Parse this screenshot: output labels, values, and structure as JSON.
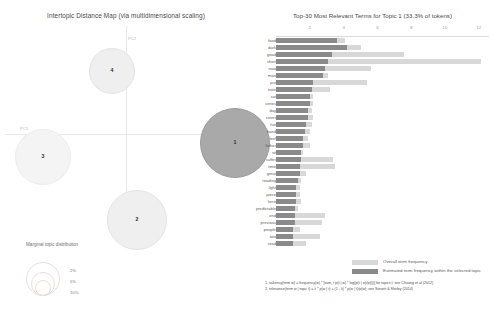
{
  "intertopic": {
    "title": "Intertopic Distance Map (via multidimensional scaling)",
    "axis": {
      "x_label": "PC1",
      "y_label": "PC2"
    },
    "topics": [
      {
        "id": "1",
        "label": "1",
        "x": 229,
        "y": 143,
        "r": 35,
        "style": "selected"
      },
      {
        "id": "2",
        "label": "2",
        "x": 131,
        "y": 220,
        "r": 30,
        "style": "plain"
      },
      {
        "id": "3",
        "label": "3",
        "x": 37,
        "y": 157,
        "r": 28,
        "style": "faint"
      },
      {
        "id": "4",
        "label": "4",
        "x": 106,
        "y": 71,
        "r": 23,
        "style": "plain"
      }
    ],
    "marginal_legend": {
      "title": "Marginal topic distribution",
      "sizes": [
        "2%",
        "5%",
        "10%"
      ]
    }
  },
  "barchart": {
    "title": "Top-30 Most Relevant Terms for Topic 1 (33.3% of tokens)",
    "topic_number": "1",
    "topic_share": "33.3% of tokens",
    "axis": {
      "ticks": [
        "2",
        "4",
        "6",
        "8",
        "10",
        "12"
      ],
      "max": 12.6
    },
    "legend": [
      {
        "swatch": "#d8d8d8",
        "label": "Overall term frequency"
      },
      {
        "swatch": "#8a8a8a",
        "label": "Estimated term frequency within the selected topic"
      }
    ],
    "colors": {
      "overall": "#d8d8d8",
      "topic": "#8a8a8a",
      "selected_bubble": "#a9a9a9",
      "plain_bubble": "#efefef"
    },
    "terms": [
      {
        "term": "food",
        "overall": 4.1,
        "topic": 3.6
      },
      {
        "term": "dark",
        "overall": 5.0,
        "topic": 4.2
      },
      {
        "term": "good",
        "overall": 7.6,
        "topic": 3.3
      },
      {
        "term": "short",
        "overall": 12.1,
        "topic": 3.1
      },
      {
        "term": "now",
        "overall": 5.6,
        "topic": 2.9
      },
      {
        "term": "man",
        "overall": 3.1,
        "topic": 2.8
      },
      {
        "term": "put",
        "overall": 5.4,
        "topic": 2.2
      },
      {
        "term": "note",
        "overall": 3.2,
        "topic": 2.1
      },
      {
        "term": "sat",
        "overall": 2.2,
        "topic": 2.0
      },
      {
        "term": "series",
        "overall": 2.2,
        "topic": 2.0
      },
      {
        "term": "day",
        "overall": 2.1,
        "topic": 1.9
      },
      {
        "term": "cover",
        "overall": 2.2,
        "topic": 1.9
      },
      {
        "term": "fun",
        "overall": 2.1,
        "topic": 1.8
      },
      {
        "term": "band",
        "overall": 2.0,
        "topic": 1.7
      },
      {
        "term": "feel",
        "overall": 1.9,
        "topic": 1.6
      },
      {
        "term": "father",
        "overall": 2.0,
        "topic": 1.6
      },
      {
        "term": "sit",
        "overall": 1.6,
        "topic": 1.5
      },
      {
        "term": "suffer",
        "overall": 3.4,
        "topic": 1.5
      },
      {
        "term": "time",
        "overall": 3.5,
        "topic": 1.4
      },
      {
        "term": "great",
        "overall": 1.8,
        "topic": 1.4
      },
      {
        "term": "reading",
        "overall": 1.5,
        "topic": 1.3
      },
      {
        "term": "light",
        "overall": 1.4,
        "topic": 1.2
      },
      {
        "term": "piece",
        "overall": 1.4,
        "topic": 1.2
      },
      {
        "term": "hero",
        "overall": 1.5,
        "topic": 1.2
      },
      {
        "term": "predictable",
        "overall": 1.3,
        "topic": 1.1
      },
      {
        "term": "end",
        "overall": 2.9,
        "topic": 1.1
      },
      {
        "term": "previous",
        "overall": 2.7,
        "topic": 1.1
      },
      {
        "term": "people",
        "overall": 1.4,
        "topic": 1.0
      },
      {
        "term": "two",
        "overall": 2.6,
        "topic": 1.0
      },
      {
        "term": "read",
        "overall": 1.8,
        "topic": 1.0
      }
    ]
  },
  "footnotes": [
    "1. saliency(term w) = frequency(w) * [sum_t p(t | w) * log(p(t | w)/p(t))] for topics t; see Chuang et al (2012)",
    "2. relevance(term w | topic t) = λ * p(w | t) + (1 - λ) * p(w | t)/p(w); see Sievert & Shirley (2014)"
  ],
  "chart_data": {
    "type": "bar",
    "title": "Top-30 Most Relevant Terms for Topic 1 (33.3% of tokens)",
    "orientation": "horizontal",
    "xlabel": "",
    "ylabel": "",
    "xlim": [
      0,
      12.6
    ],
    "grid": false,
    "legend_position": "bottom",
    "categories": [
      "food",
      "dark",
      "good",
      "short",
      "now",
      "man",
      "put",
      "note",
      "sat",
      "series",
      "day",
      "cover",
      "fun",
      "band",
      "feel",
      "father",
      "sit",
      "suffer",
      "time",
      "great",
      "reading",
      "light",
      "piece",
      "hero",
      "predictable",
      "end",
      "previous",
      "people",
      "two",
      "read"
    ],
    "series": [
      {
        "name": "Overall term frequency",
        "color": "#d8d8d8",
        "values": [
          4.1,
          5.0,
          7.6,
          12.1,
          5.6,
          3.1,
          5.4,
          3.2,
          2.2,
          2.2,
          2.1,
          2.2,
          2.1,
          2.0,
          1.9,
          2.0,
          1.6,
          3.4,
          3.5,
          1.8,
          1.5,
          1.4,
          1.4,
          1.5,
          1.3,
          2.9,
          2.7,
          1.4,
          2.6,
          1.8
        ]
      },
      {
        "name": "Estimated term frequency within the selected topic",
        "color": "#8a8a8a",
        "values": [
          3.6,
          4.2,
          3.3,
          3.1,
          2.9,
          2.8,
          2.2,
          2.1,
          2.0,
          2.0,
          1.9,
          1.9,
          1.8,
          1.7,
          1.6,
          1.6,
          1.5,
          1.5,
          1.4,
          1.4,
          1.3,
          1.2,
          1.2,
          1.2,
          1.1,
          1.1,
          1.1,
          1.0,
          1.0,
          1.0
        ]
      }
    ],
    "tick_labels": [
      "2",
      "4",
      "6",
      "8",
      "10",
      "12"
    ]
  }
}
